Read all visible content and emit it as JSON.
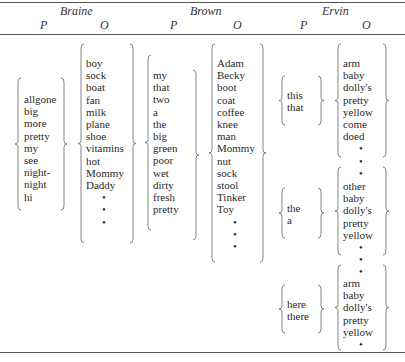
{
  "headers": {
    "groups": [
      "Braine",
      "Brown",
      "Ervin"
    ],
    "subcolumns": [
      "P",
      "O",
      "P",
      "O",
      "P",
      "O"
    ]
  },
  "table": {
    "braine": {
      "P": [
        "allgone",
        "big",
        "more",
        "pretty",
        "my",
        "see",
        "night-",
        "night",
        "hi"
      ],
      "O": [
        "boy",
        "sock",
        "boat",
        "fan",
        "milk",
        "plane",
        "shoe",
        "vitamins",
        "hot",
        "Mommy",
        "Daddy",
        "•",
        "•",
        "•"
      ]
    },
    "brown": {
      "P": [
        "my",
        "that",
        "two",
        "a",
        "the",
        "big",
        "green",
        "poor",
        "wet",
        "dirty",
        "fresh",
        "pretty"
      ],
      "O": [
        "Adam",
        "Becky",
        "boot",
        "coat",
        "coffee",
        "knee",
        "man",
        "Mommy",
        "nut",
        "sock",
        "stool",
        "Tinker",
        "Toy",
        "•",
        "•",
        "•"
      ]
    },
    "ervin": [
      {
        "P": [
          "this",
          "that"
        ],
        "O": [
          "arm",
          "baby",
          "dolly's",
          "pretty",
          "yellow",
          "come",
          "doed",
          "•"
        ]
      },
      {
        "P": [
          "the",
          "a"
        ],
        "O": [
          "other",
          "baby",
          "dolly's",
          "pretty",
          "yellow",
          "•"
        ]
      },
      {
        "P": [
          "here",
          "there"
        ],
        "O": [
          "arm",
          "baby",
          "dolly's",
          "pretty",
          "yellow",
          "•"
        ]
      }
    ],
    "ervin_between_dots": [
      "•",
      "•"
    ]
  }
}
